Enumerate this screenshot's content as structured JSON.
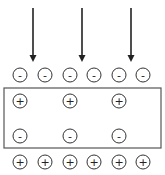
{
  "diagram": {
    "arrows": [
      {
        "x": 33,
        "y1": 8,
        "y2": 62
      },
      {
        "x": 82,
        "y1": 8,
        "y2": 62
      },
      {
        "x": 131,
        "y1": 8,
        "y2": 62
      }
    ],
    "top_row": {
      "y": 75,
      "charges": [
        {
          "x": 20,
          "sign": "-"
        },
        {
          "x": 45,
          "sign": "-"
        },
        {
          "x": 70,
          "sign": "-"
        },
        {
          "x": 94,
          "sign": "-"
        },
        {
          "x": 119,
          "sign": "-"
        },
        {
          "x": 143,
          "sign": "-"
        }
      ]
    },
    "box": {
      "x": 4,
      "y": 88,
      "width": 157,
      "height": 60
    },
    "box_top_row": {
      "y": 101,
      "charges": [
        {
          "x": 20,
          "sign": "+"
        },
        {
          "x": 70,
          "sign": "+"
        },
        {
          "x": 119,
          "sign": "+"
        }
      ]
    },
    "box_bottom_row": {
      "y": 136,
      "charges": [
        {
          "x": 20,
          "sign": "-"
        },
        {
          "x": 70,
          "sign": "-"
        },
        {
          "x": 119,
          "sign": "-"
        }
      ]
    },
    "bottom_row": {
      "y": 162,
      "charges": [
        {
          "x": 20,
          "sign": "+"
        },
        {
          "x": 45,
          "sign": "+"
        },
        {
          "x": 70,
          "sign": "+"
        },
        {
          "x": 94,
          "sign": "+"
        },
        {
          "x": 119,
          "sign": "+"
        },
        {
          "x": 143,
          "sign": "+"
        }
      ]
    },
    "radius": 7
  }
}
